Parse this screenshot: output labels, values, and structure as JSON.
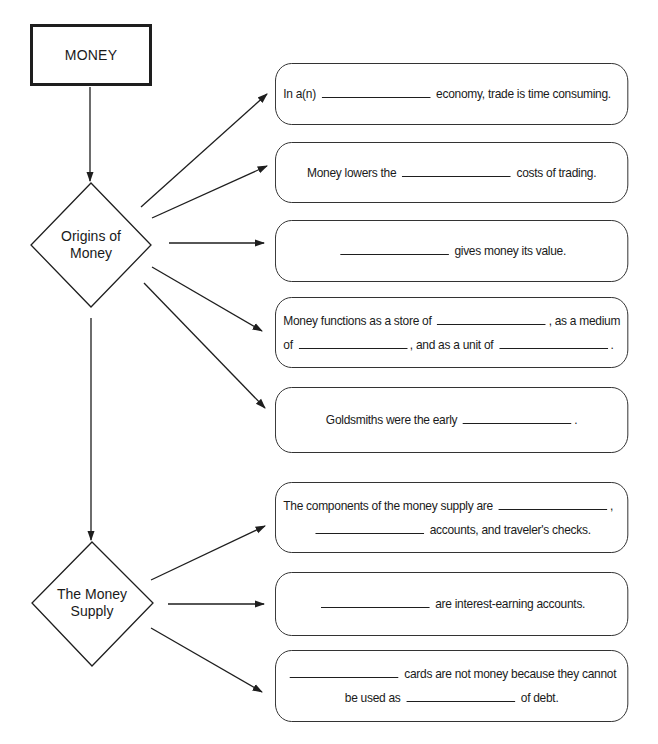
{
  "diagram": {
    "root": {
      "label": "MONEY"
    },
    "branches": [
      {
        "label_lines": [
          "Origins of",
          "Money"
        ],
        "items": [
          {
            "segments": [
              [
                "In a(n)",
                "_",
                "economy, trade is time consuming."
              ]
            ]
          },
          {
            "segments": [
              [
                "Money lowers the",
                "_",
                "costs of trading."
              ]
            ]
          },
          {
            "segments": [
              [
                "",
                "_",
                "gives money its value."
              ]
            ]
          },
          {
            "segments": [
              [
                "Money functions as a store of",
                "_",
                ", as a medium"
              ],
              [
                "of",
                "_",
                ", and as a unit of",
                "_",
                "."
              ]
            ]
          },
          {
            "segments": [
              [
                "Goldsmiths were the early",
                "_",
                "."
              ]
            ]
          }
        ]
      },
      {
        "label_lines": [
          "The Money",
          "Supply"
        ],
        "items": [
          {
            "segments": [
              [
                "The components of the money supply are",
                "_",
                ","
              ],
              [
                "",
                "_",
                "accounts, and traveler's checks."
              ]
            ]
          },
          {
            "segments": [
              [
                "",
                "_",
                "are interest-earning accounts."
              ]
            ]
          },
          {
            "segments": [
              [
                "",
                "_",
                "cards are not money because they cannot"
              ],
              [
                "be used as",
                "_",
                "of debt."
              ]
            ]
          }
        ]
      }
    ]
  },
  "text": {
    "root": "MONEY",
    "origins_line1": "Origins of",
    "origins_line2": "Money",
    "supply_line1": "The Money",
    "supply_line2": "Supply",
    "n1_a": "In a(n)",
    "n1_b": "economy, trade is time consuming.",
    "n2_a": "Money lowers the",
    "n2_b": "costs of trading.",
    "n3_b": "gives money its value.",
    "n4_a": "Money functions as a store of",
    "n4_b": ", as a medium",
    "n4_c": "of",
    "n4_d": ", and as a unit of",
    "n4_e": ".",
    "n5_a": "Goldsmiths were the early",
    "n5_b": ".",
    "n6_a": "The components of the money supply are",
    "n6_b": ",",
    "n6_c": "accounts, and traveler's checks.",
    "n7_b": "are interest-earning accounts.",
    "n8_b": "cards are not money because they cannot",
    "n8_c": "be used as",
    "n8_d": "of debt."
  },
  "colors": {
    "stroke": "#1e1e1e",
    "background": "#ffffff",
    "text": "#1a1a1a"
  }
}
